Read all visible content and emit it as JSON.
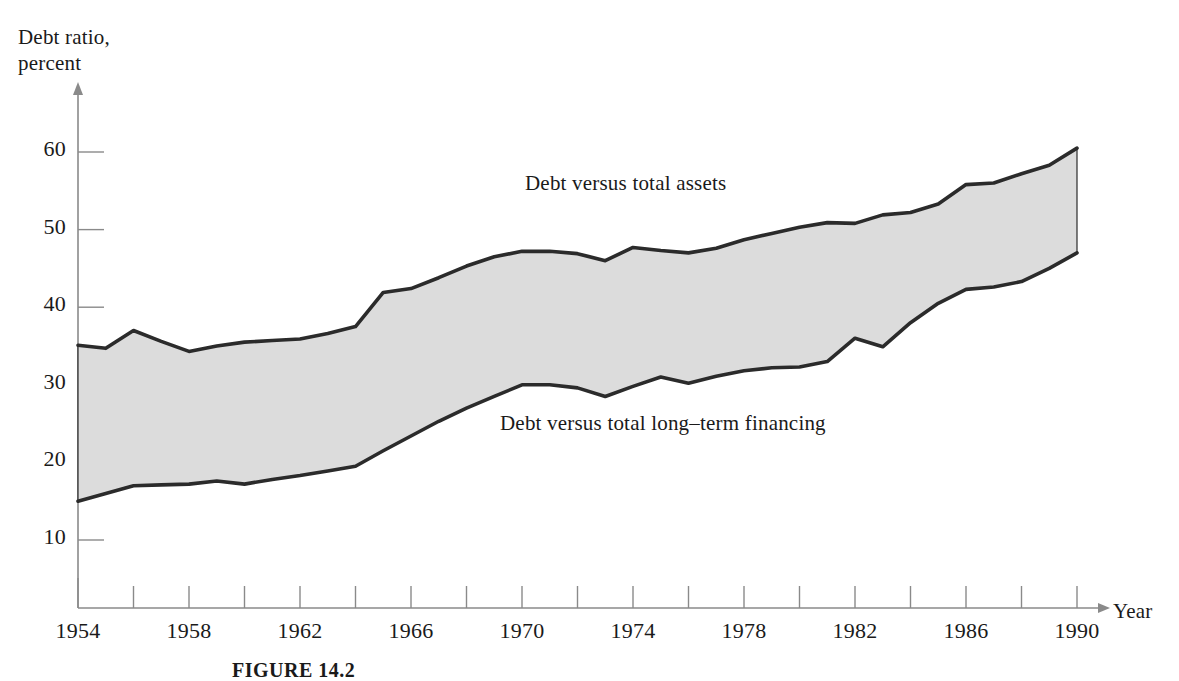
{
  "caption": "FIGURE 14.2",
  "chart_data": {
    "type": "area",
    "title": "",
    "xlabel": "Year",
    "ylabel": "Debt ratio,\npercent",
    "xlim": [
      1954,
      1990
    ],
    "ylim": [
      0,
      65
    ],
    "grid": false,
    "legend_position": "inline-annotation",
    "fill_color": "#dcdcdc",
    "line_color": "#2b2b2b",
    "axis_color": "#8a8a8a",
    "x": [
      1954,
      1955,
      1956,
      1957,
      1958,
      1959,
      1960,
      1961,
      1962,
      1963,
      1964,
      1965,
      1966,
      1967,
      1968,
      1969,
      1970,
      1971,
      1972,
      1973,
      1974,
      1975,
      1976,
      1977,
      1978,
      1979,
      1980,
      1981,
      1982,
      1983,
      1984,
      1985,
      1986,
      1987,
      1988,
      1989,
      1990
    ],
    "ytick_labels": [
      "10",
      "20",
      "30",
      "40",
      "50",
      "60"
    ],
    "yticks": [
      10,
      20,
      30,
      40,
      50,
      60
    ],
    "xtick_labels": [
      "1954",
      "1958",
      "1962",
      "1966",
      "1970",
      "1974",
      "1978",
      "1982",
      "1986",
      "1990"
    ],
    "xticks_labeled": [
      1954,
      1958,
      1962,
      1966,
      1970,
      1974,
      1978,
      1982,
      1986,
      1990
    ],
    "xticks_minor": [
      1956,
      1960,
      1964,
      1968,
      1972,
      1976,
      1980,
      1984,
      1988
    ],
    "series": [
      {
        "name": "Debt versus total assets",
        "annotation": "Debt versus total assets",
        "values": [
          35.1,
          34.7,
          37.0,
          35.6,
          34.3,
          35.0,
          35.5,
          35.7,
          35.9,
          36.6,
          37.5,
          41.9,
          42.4,
          43.8,
          45.3,
          46.5,
          47.2,
          47.2,
          46.9,
          46.0,
          47.7,
          47.3,
          47.0,
          47.6,
          48.7,
          49.5,
          50.3,
          50.9,
          50.8,
          51.9,
          52.2,
          53.3,
          55.8,
          56.0,
          57.2,
          58.3,
          60.5
        ]
      },
      {
        "name": "Debt versus total long-term financing",
        "annotation": "Debt versus total long–term financing",
        "values": [
          15.0,
          16.0,
          17.0,
          17.1,
          17.2,
          17.6,
          17.2,
          17.8,
          18.3,
          18.9,
          19.5,
          21.5,
          23.4,
          25.3,
          27.0,
          28.5,
          30.0,
          30.0,
          29.6,
          28.5,
          29.8,
          31.0,
          30.2,
          31.1,
          31.8,
          32.2,
          32.3,
          33.0,
          36.0,
          34.9,
          38.0,
          40.5,
          42.3,
          42.6,
          43.3,
          45.0,
          47.0
        ]
      }
    ]
  }
}
